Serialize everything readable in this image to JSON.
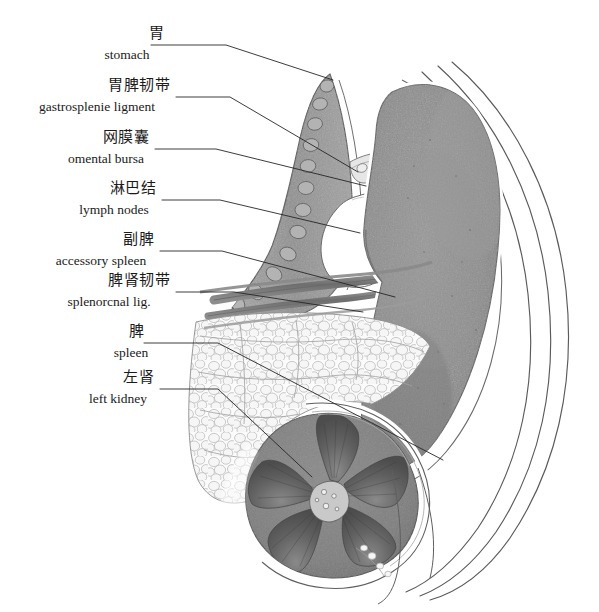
{
  "figure": {
    "style": "grayscale medical pencil/wash illustration",
    "background_color": "#ffffff",
    "line_color": "#2a2a2a",
    "palette": {
      "spleen_fill": "#8d8d8d",
      "spleen_edge": "#6f6f6f",
      "stomach_wall": "#9a9a9a",
      "kidney_cortex": "#8a8a8a",
      "kidney_medulla": "#5f5f5f",
      "fat_lobule": "#f4f4f4",
      "fat_outline": "#a9a9a9",
      "vessel": "#7b7b7b",
      "body_wall_line": "#555555"
    }
  },
  "labels": [
    {
      "id": "stomach",
      "cn": "胃",
      "en": "stomach",
      "cn_x": 140,
      "cn_y": 33,
      "en_x": 98,
      "en_y": 52,
      "leader": "M 151,45 L 226,45 L 333,80"
    },
    {
      "id": "gastrosplenic-ligament",
      "cn": "胃脾韧带",
      "en": "gastrosplenie ligment",
      "cn_x": 104,
      "cn_y": 85,
      "en_x": 28,
      "en_y": 104,
      "leader": "M 176,97 L 230,97 L 358,172"
    },
    {
      "id": "omental-bursa",
      "cn": "网膜囊",
      "en": "omental bursa",
      "cn_x": 98,
      "cn_y": 137,
      "en_x": 68,
      "en_y": 156,
      "leader": "M 155,149 L 216,149 L 366,186"
    },
    {
      "id": "lymph-nodes",
      "cn": "淋巴结",
      "en": "lymph nodes",
      "cn_x": 105,
      "cn_y": 188,
      "en_x": 78,
      "en_y": 207,
      "leader": "M 162,200 L 220,200 L 360,233"
    },
    {
      "id": "accessory-spleen",
      "cn": "副脾",
      "en": "accessory spleen",
      "cn_x": 119,
      "cn_y": 239,
      "en_x": 58,
      "en_y": 258,
      "leader": "M 160,251 L 222,251 L 395,297"
    },
    {
      "id": "splenorenal-ligament",
      "cn": "脾肾韧带",
      "en": "splenorcnal lig.",
      "cn_x": 104,
      "cn_y": 280,
      "en_x": 54,
      "en_y": 299,
      "leader": "M 176,292 L 234,292 L 363,312"
    },
    {
      "id": "spleen",
      "cn": "脾",
      "en": "spleen",
      "cn_x": 133,
      "cn_y": 331,
      "en_x": 105,
      "en_y": 350,
      "leader": "M 144,343 L 218,343 L 443,460"
    },
    {
      "id": "left-kidney",
      "cn": "左肾",
      "en": "left kidney",
      "cn_x": 119,
      "cn_y": 377,
      "en_x": 85,
      "en_y": 396,
      "leader": "M 160,389 L 218,389 L 312,477"
    }
  ],
  "structures": [
    {
      "id": "stomach-wall",
      "name": "stomach wall with rugae"
    },
    {
      "id": "spleen-body",
      "name": "spleen"
    },
    {
      "id": "left-kidney-section",
      "name": "left kidney cross-section"
    },
    {
      "id": "perirenal-fat",
      "name": "perirenal fat lobules"
    },
    {
      "id": "splenic-vessels",
      "name": "splenic artery and vein branches"
    },
    {
      "id": "accessory-spleen-nodule",
      "name": "accessory spleen nodule"
    },
    {
      "id": "omental-bursa-cavity",
      "name": "omental bursa cavity"
    },
    {
      "id": "body-wall",
      "name": "posterolateral body wall layers"
    },
    {
      "id": "diaphragm-arc",
      "name": "diaphragm arc"
    }
  ]
}
